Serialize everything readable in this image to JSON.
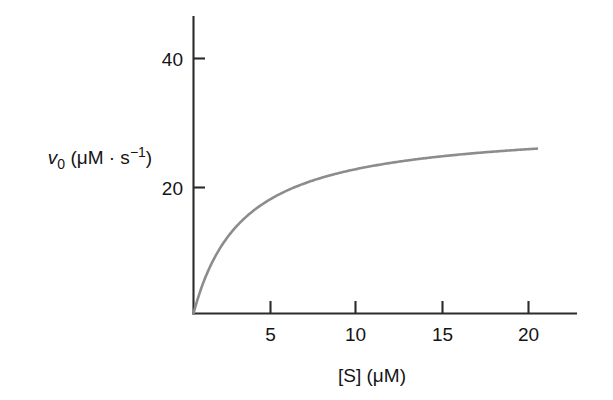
{
  "figure": {
    "background_color": "#ffffff",
    "axis_color": "#2b2b2b",
    "curve_color": "#8c8c8c",
    "text_color": "#141414"
  },
  "axes": {
    "y_label_parts": {
      "symbol": "v",
      "subscript": "0",
      "units": " (μM · s",
      "units_exponent": "−1",
      "units_close": ")"
    },
    "y_label_plain": "v0 (μM · s−1)",
    "x_label_parts": {
      "species": "[S] (μM)"
    },
    "x_label_plain": "[S] (μM)",
    "x_ticks": [
      "5",
      "10",
      "15",
      "20"
    ],
    "y_ticks": [
      "20",
      "40"
    ]
  },
  "chart_data": {
    "type": "line",
    "title": "",
    "subtitle": "",
    "xlabel": "[S] (μM)",
    "ylabel": "v0 (μM · s−1)",
    "xlim": [
      0,
      22
    ],
    "ylim": [
      0,
      46
    ],
    "xticks": [
      5,
      10,
      15,
      20
    ],
    "yticks": [
      20,
      40
    ],
    "grid": false,
    "legend": false,
    "legend_position": "none",
    "annotations": [],
    "model": {
      "name": "Michaelis-Menten",
      "equation": "v0 = Vmax * [S] / (Km + [S])",
      "Vmax": 30,
      "Km": 3
    },
    "series": [
      {
        "name": "v0 vs [S]",
        "color": "#8c8c8c",
        "x": [
          0,
          0.5,
          1,
          1.5,
          2,
          2.5,
          3,
          3.5,
          4,
          4.5,
          5,
          6,
          7,
          8,
          9,
          10,
          11,
          12,
          13,
          14,
          15,
          16,
          17,
          18,
          19,
          20,
          20.5
        ],
        "y": [
          0,
          4.3,
          7.5,
          10.0,
          12.0,
          13.6,
          15.0,
          16.2,
          17.1,
          18.0,
          18.8,
          20.0,
          21.0,
          21.8,
          22.5,
          23.1,
          23.6,
          24.0,
          24.4,
          24.7,
          25.0,
          25.3,
          25.5,
          25.7,
          25.9,
          26.1,
          26.1
        ]
      }
    ],
    "plateau_value": 30
  }
}
